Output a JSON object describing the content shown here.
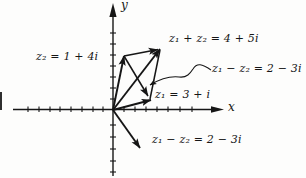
{
  "labels": {
    "y_axis": "y",
    "x_axis": "x",
    "z2": "z₂ = 1 + 4i",
    "sum": "z₁ + z₂ = 4 + 5i",
    "diff_top": "z₁ − z₂ = 2 − 3i",
    "z1": "z₁ = 3 + i",
    "diff_bottom": "z₁ − z₂ = 2 − 3i"
  },
  "figure": {
    "type": "complex-plane-vector-diagram",
    "vectors": [
      {
        "name": "z1",
        "value": "3 + i",
        "label": "z₁ = 3 + i",
        "from": "origin"
      },
      {
        "name": "z2",
        "value": "1 + 4i",
        "label": "z₂ = 1 + 4i",
        "from": "origin"
      },
      {
        "name": "z1+z2",
        "value": "4 + 5i",
        "label": "z₁ + z₂ = 4 + 5i",
        "from": "origin"
      },
      {
        "name": "z1-z2",
        "value": "2 − 3i",
        "label": "z₁ − z₂ = 2 − 3i",
        "from": "origin"
      },
      {
        "name": "z1-z2-translated",
        "value": "2 − 3i",
        "label": "z₁ − z₂ = 2 − 3i",
        "from": "tip of z2 to tip of z1"
      }
    ],
    "construction": "parallelogram rule for addition of complex numbers"
  },
  "colors": {
    "ink": "#161616",
    "background": "#fdfdfc"
  }
}
